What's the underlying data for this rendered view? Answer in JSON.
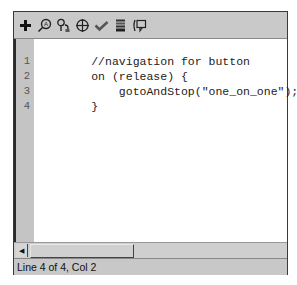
{
  "toolbar": {
    "icons": [
      {
        "name": "add-statement-icon",
        "glyph": "+"
      },
      {
        "name": "find-icon",
        "glyph": "find"
      },
      {
        "name": "replace-icon",
        "glyph": "replace"
      },
      {
        "name": "insert-target-path-icon",
        "glyph": "target"
      },
      {
        "name": "check-syntax-icon",
        "glyph": "check"
      },
      {
        "name": "auto-format-icon",
        "glyph": "format"
      },
      {
        "name": "show-code-hint-icon",
        "glyph": "hint"
      }
    ]
  },
  "editor": {
    "lines": [
      {
        "number": "1",
        "text": "//navigation for button"
      },
      {
        "number": "2",
        "text": "on (release) {"
      },
      {
        "number": "3",
        "text": "    gotoAndStop(\"one_on_one\");"
      },
      {
        "number": "4",
        "text": "}"
      }
    ]
  },
  "scrollbar": {
    "left_arrow": "◀"
  },
  "status": {
    "text": "Line 4 of 4, Col 2"
  }
}
